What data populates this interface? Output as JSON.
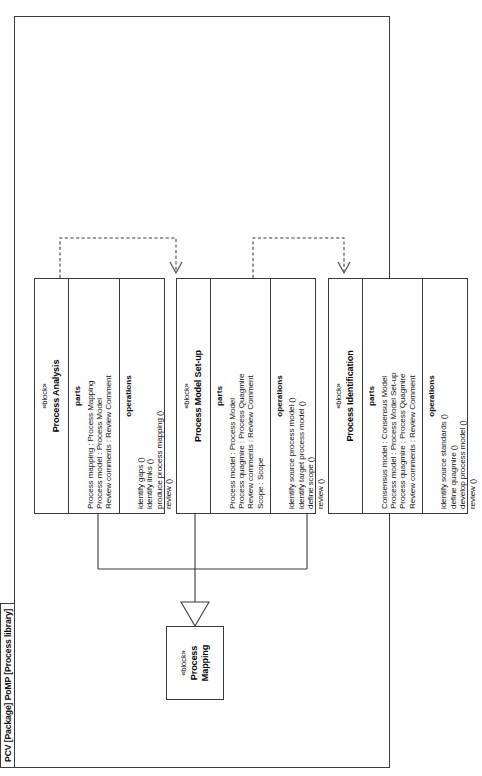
{
  "diagram": {
    "type": "uml-block-definition-diagram",
    "package_label": "PCV [Package] PoMP [Process library]",
    "stereotype": "«block»",
    "parts_heading": "parts",
    "operations_heading": "operations",
    "line_color": "#3a3a3a",
    "background": "#ffffff"
  },
  "root_block": {
    "stereotype": "«block»",
    "name": "Process Mapping"
  },
  "blocks": [
    {
      "id": "process-identification",
      "stereotype": "«block»",
      "name": "Process Identification",
      "parts_heading": "parts",
      "parts": [
        "Consensus model : Consensus Model",
        "Process model : Process Model Set-up",
        "Process quagmire : Process Quagmire",
        "Review comments : Review Comment"
      ],
      "operations_heading": "operations",
      "operations": [
        "identify source standards ()",
        "define quagmire ()",
        "develop process model ()",
        "review ()"
      ]
    },
    {
      "id": "process-model-set-up",
      "stereotype": "«block»",
      "name": "Process Model Set-up",
      "parts_heading": "parts",
      "parts": [
        "Process model : Process Model",
        "Process quagmire : Process Quagmire",
        "Review comments : Review Comment",
        "Scope : Scope"
      ],
      "operations_heading": "operations",
      "operations": [
        "identify source process model ()",
        "identify target process model ()",
        "define scope ()",
        "review ()"
      ]
    },
    {
      "id": "process-analysis",
      "stereotype": "«block»",
      "name": "Process Analysis",
      "parts_heading": "parts",
      "parts": [
        "Process mapping : Process Mapping",
        "Process model : Process Model",
        "Review comments : Review Comment"
      ],
      "operations_heading": "operations",
      "operations": [
        "identify gaps ()",
        "identify links ()",
        "produce process mapping ()",
        "review ()"
      ]
    }
  ],
  "relationships": [
    {
      "kind": "generalization",
      "from": "process-identification",
      "to": "root_block"
    },
    {
      "kind": "generalization",
      "from": "process-model-set-up",
      "to": "root_block"
    },
    {
      "kind": "generalization",
      "from": "process-analysis",
      "to": "root_block"
    },
    {
      "kind": "dependency",
      "from": "process-identification",
      "to": "process-model-set-up"
    },
    {
      "kind": "dependency",
      "from": "process-model-set-up",
      "to": "process-analysis"
    }
  ]
}
